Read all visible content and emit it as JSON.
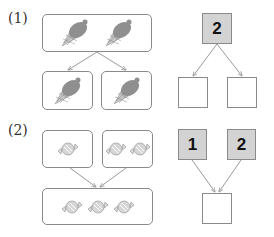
{
  "problems": [
    {
      "label": "(1)",
      "left_diagram": {
        "top_box": {
          "icon": "ice-cream-cone-icon",
          "count": 2
        },
        "bottom_boxes": [
          {
            "icon": "ice-cream-cone-icon",
            "count": 1
          },
          {
            "icon": "ice-cream-cone-icon",
            "count": 1
          }
        ]
      },
      "right_diagram": {
        "top_boxes": [
          {
            "value": "2",
            "filled": true
          }
        ],
        "bottom_boxes": [
          {
            "value": "",
            "filled": false
          },
          {
            "value": "",
            "filled": false
          }
        ]
      }
    },
    {
      "label": "(2)",
      "left_diagram": {
        "top_boxes": [
          {
            "icon": "candy-icon",
            "count": 1
          },
          {
            "icon": "candy-icon",
            "count": 2
          }
        ],
        "bottom_box": {
          "icon": "candy-icon",
          "count": 3
        }
      },
      "right_diagram": {
        "top_boxes": [
          {
            "value": "1",
            "filled": true
          },
          {
            "value": "2",
            "filled": true
          }
        ],
        "bottom_boxes": [
          {
            "value": "",
            "filled": false
          }
        ]
      }
    }
  ],
  "colors": {
    "border": "#8a8a8a",
    "filled_box": "#d3d3d3",
    "arrow": "#9a9a9a",
    "icon_scoop": "#8f8f8f",
    "icon_cone": "#c8c8c8"
  }
}
